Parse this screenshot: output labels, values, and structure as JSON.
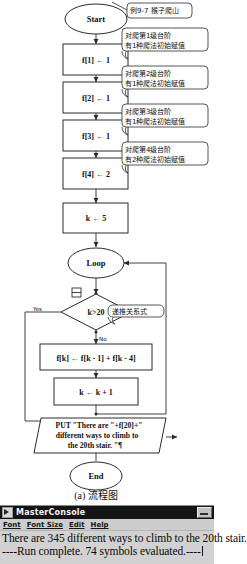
{
  "flowchart": {
    "title_annotation": "例9-7 猴子爬山",
    "caption": "(a) 流程图",
    "nodes": {
      "start": "Start",
      "init1": "f[1] ← 1",
      "init2": "f[2] ← 1",
      "init3": "f[3] ← 1",
      "init4": "f[4] ← 2",
      "k_init": "k ← 5",
      "loop": "Loop",
      "decision": "k>20",
      "recurrence": "f[k] ← f[k - 1] + f[k - 4]",
      "increment": "k ← k + 1",
      "output_line1": "PUT \"There are \"+f[20]+\"",
      "output_line2": "different ways to climb to",
      "output_line3": "the 20th stair. \"¶",
      "end": "End"
    },
    "branch_labels": {
      "yes": "Yes",
      "no": "No"
    },
    "annotations": {
      "a1_line1": "对爬第1级台阶",
      "a1_line2": "有1种爬法初始赋值",
      "a2_line1": "对爬第2级台阶",
      "a2_line2": "有1种爬法初始赋值",
      "a3_line1": "对爬第3级台阶",
      "a3_line2": "有1种爬法初始赋值",
      "a4_line1": "对爬第4级台阶",
      "a4_line2": "有2种爬法初始赋值",
      "a5": "递推关系式"
    }
  },
  "console": {
    "title": "MasterConsole",
    "minimize_label": "_",
    "menu": [
      "Font",
      "Font Size",
      "Edit",
      "Help"
    ],
    "output_line1": "There are 345 different ways to climb to the 20th stair.",
    "output_line2": "----Run complete.  74 symbols evaluated.----"
  },
  "colors": {
    "stroke": "#2b2b2b",
    "node_fill": "#ffffff",
    "titlebar": "#141414",
    "window_face": "#cdcdcd"
  }
}
